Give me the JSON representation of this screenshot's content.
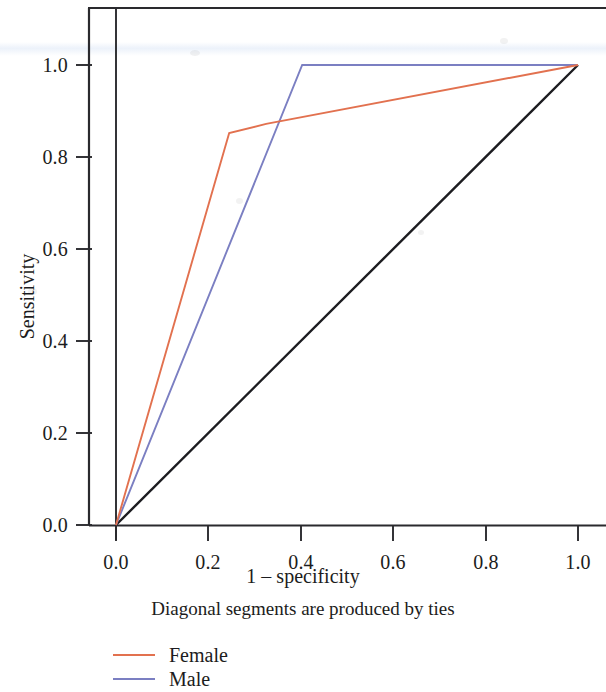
{
  "chart_data": {
    "type": "line",
    "title": "",
    "subtitle": "Diagonal segments are produced by ties",
    "xlabel": "1 – specificity",
    "ylabel": "Sensitivity",
    "xlim": [
      0.0,
      1.0
    ],
    "ylim": [
      0.0,
      1.0
    ],
    "grid": false,
    "legend_position": "below-left",
    "xticks": [
      "0.0",
      "0.2",
      "0.4",
      "0.6",
      "0.8",
      "1.0"
    ],
    "xtick_values": [
      0.0,
      0.2,
      0.4,
      0.6,
      0.8,
      1.0
    ],
    "yticks": [
      "0.0",
      "0.2",
      "0.4",
      "0.6",
      "0.8",
      "1.0"
    ],
    "ytick_values": [
      0.0,
      0.2,
      0.4,
      0.6,
      0.8,
      1.0
    ],
    "series": [
      {
        "name": "Female",
        "color": "#e2714f",
        "x": [
          0.0,
          0.245,
          0.325,
          1.0
        ],
        "y": [
          0.0,
          0.852,
          0.872,
          1.0
        ]
      },
      {
        "name": "Male",
        "color": "#7b7fc2",
        "x": [
          0.0,
          0.403,
          1.0
        ],
        "y": [
          0.0,
          1.0,
          1.0
        ]
      },
      {
        "name": "Reference line",
        "color": "#1c1c20",
        "x": [
          0.0,
          1.0
        ],
        "y": [
          0.0,
          1.0
        ]
      }
    ]
  },
  "legend": {
    "items": [
      {
        "label": "Female",
        "color": "#e2714f"
      },
      {
        "label": "Male",
        "color": "#7b7fc2"
      }
    ]
  },
  "axes": {
    "y_title": "Sensitivity",
    "x_title": "1 – specificity",
    "subtitle": "Diagonal segments are produced by ties",
    "y_tick_labels": [
      "1.0",
      "0.8",
      "0.6",
      "0.4",
      "0.2",
      "0.0"
    ],
    "x_tick_labels": [
      "0.0",
      "0.2",
      "0.4",
      "0.6",
      "0.8",
      "1.0"
    ]
  },
  "colors": {
    "female": "#e2714f",
    "male": "#7b7fc2",
    "reference": "#1c1c20",
    "axis": "#2a2a2e",
    "text": "#1c1c20",
    "background": "#ffffff"
  }
}
